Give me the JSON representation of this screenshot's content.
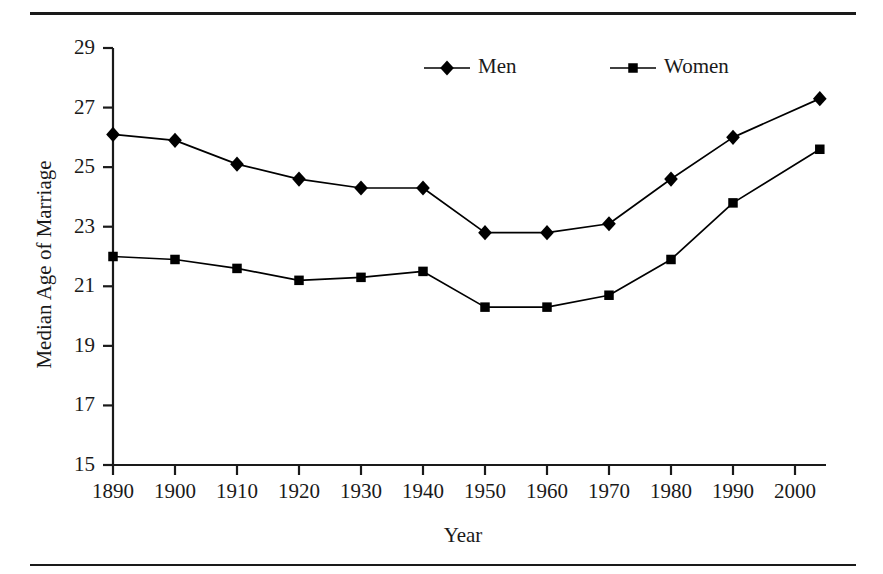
{
  "figure": {
    "top_rule": "horizontal-rule",
    "bottom_rule": "horizontal-rule"
  },
  "chart_data": {
    "type": "line",
    "title": "",
    "xlabel": "Year",
    "ylabel": "Median Age of Marriage",
    "xlim": [
      1890,
      2005
    ],
    "ylim": [
      15,
      29
    ],
    "ytick_labels": [
      "15",
      "17",
      "19",
      "21",
      "23",
      "25",
      "27",
      "29"
    ],
    "yticks": [
      15,
      17,
      19,
      21,
      23,
      25,
      27,
      29
    ],
    "xtick_labels": [
      "1890",
      "1900",
      "1910",
      "1920",
      "1930",
      "1940",
      "1950",
      "1960",
      "1970",
      "1980",
      "1990",
      "2000"
    ],
    "xticks": [
      1890,
      1900,
      1910,
      1920,
      1930,
      1940,
      1950,
      1960,
      1970,
      1980,
      1990,
      2000
    ],
    "grid": false,
    "legend_position": "top-center",
    "x": [
      1890,
      1900,
      1910,
      1920,
      1930,
      1940,
      1950,
      1960,
      1970,
      1980,
      1990,
      2004
    ],
    "series": [
      {
        "name": "Men",
        "marker": "diamond",
        "color": "#000000",
        "values": [
          26.1,
          25.9,
          25.1,
          24.6,
          24.3,
          24.3,
          22.8,
          22.8,
          23.1,
          24.6,
          26.0,
          27.3
        ]
      },
      {
        "name": "Women",
        "marker": "square",
        "color": "#000000",
        "values": [
          22.0,
          21.9,
          21.6,
          21.2,
          21.3,
          21.5,
          20.3,
          20.3,
          20.7,
          21.9,
          23.8,
          25.6
        ]
      }
    ],
    "legend": [
      {
        "label": "Men",
        "marker": "diamond"
      },
      {
        "label": "Women",
        "marker": "square"
      }
    ]
  }
}
